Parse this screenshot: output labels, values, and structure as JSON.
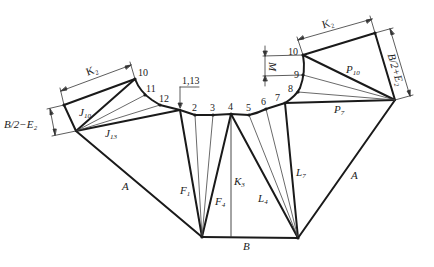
{
  "diagram": {
    "colors": {
      "line": "#1a1a1a",
      "thin_line": "#444444",
      "background": "#ffffff"
    },
    "labels": {
      "k2_left": "K₂",
      "k2_right": "K₂",
      "b2_minus_e2": "B/2−E₂",
      "b2_plus_e2": "B/2+E₂",
      "m": "M",
      "j10": "J",
      "j10_sub": "10",
      "j13": "J",
      "j13_sub": "13",
      "p10": "P",
      "p10_sub": "10",
      "p7": "P",
      "p7_sub": "7",
      "a_left": "A",
      "a_right": "A",
      "b": "B",
      "f1": "F",
      "f1_sub": "1",
      "f4": "F",
      "f4_sub": "4",
      "k3": "K",
      "k3_sub": "3",
      "l4": "L",
      "l4_sub": "4",
      "l7": "L",
      "l7_sub": "7",
      "seam": "1,13"
    },
    "point_numbers": {
      "p10_left": "10",
      "p11": "11",
      "p12": "12",
      "p2": "2",
      "p3": "3",
      "p4": "4",
      "p5": "5",
      "p6": "6",
      "p7": "7",
      "p8": "8",
      "p9": "9",
      "p10_right": "10"
    }
  }
}
